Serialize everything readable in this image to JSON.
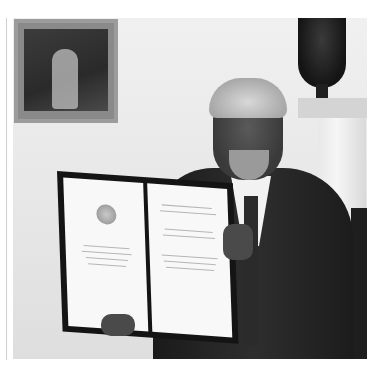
{
  "image": {
    "description": "Black-and-white photograph of a smiling older man with gray hair and beard, in a dark suit and tie, holding up an open framed diploma with a medal emblem on the left page, in a room with a framed painting, a dark urn on a mantel, and a white pillar.",
    "subjects": [
      "man-in-suit",
      "open-diploma",
      "medal-emblem",
      "framed-painting",
      "urn-vase",
      "mantel-pillar"
    ],
    "colors": {
      "background": "#ececec",
      "suit": "#1e1e1e",
      "diploma_frame": "#141414",
      "paper": "#f8f8f8"
    }
  }
}
